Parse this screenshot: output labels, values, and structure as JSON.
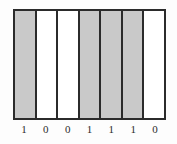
{
  "figure": {
    "name": "binary-bar-pattern",
    "frame_color": "#2b2b2b",
    "filled_color": "#c9c9c9",
    "empty_color": "#ffffff",
    "background_color": "#fdfdfd"
  },
  "chart_data": {
    "type": "bar",
    "title": "",
    "subtitle": "",
    "xlabel": "",
    "ylabel": "",
    "grid": false,
    "legend": null,
    "categories": [
      "1",
      "0",
      "0",
      "1",
      "1",
      "1",
      "0"
    ],
    "values": [
      1,
      0,
      0,
      1,
      1,
      1,
      0
    ],
    "ylim": [
      0,
      1
    ],
    "annotations": []
  },
  "cells": [
    {
      "index": 0,
      "value": "1",
      "state": "filled",
      "label": "1"
    },
    {
      "index": 1,
      "value": "0",
      "state": "empty",
      "label": "0"
    },
    {
      "index": 2,
      "value": "0",
      "state": "empty",
      "label": "0"
    },
    {
      "index": 3,
      "value": "1",
      "state": "filled",
      "label": "1"
    },
    {
      "index": 4,
      "value": "1",
      "state": "filled",
      "label": "1"
    },
    {
      "index": 5,
      "value": "1",
      "state": "filled",
      "label": "1"
    },
    {
      "index": 6,
      "value": "0",
      "state": "empty",
      "label": "0"
    }
  ]
}
